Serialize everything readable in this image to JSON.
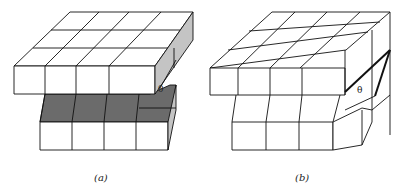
{
  "figure": {
    "panels": [
      {
        "id": "a",
        "caption": "(a)",
        "angle_label": "θ",
        "description": "Crystal lattice of cubes with edge dislocation; shaded slip plane"
      },
      {
        "id": "b",
        "caption": "(b)",
        "angle_label": "θ",
        "description": "Crystal lattice of cubes with screw dislocation"
      }
    ],
    "colors": {
      "line": "#111111",
      "dark_shade": "#6b6b6b",
      "light_shade": "#c4c4c4",
      "background": "#ffffff"
    }
  }
}
